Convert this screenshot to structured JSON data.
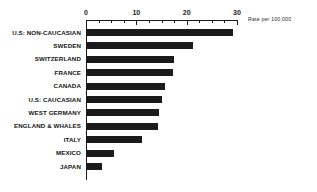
{
  "chart_data": {
    "type": "bar",
    "orientation": "horizontal",
    "title": "",
    "subtitle": "",
    "xlabel": "",
    "ylabel": "",
    "annotation": "Rate per 100,000",
    "xlim": [
      0,
      30
    ],
    "grid": false,
    "legend": null,
    "bar_color": "#1b1b1b",
    "axis_color": "#1a1a1a",
    "tick_labels": [
      "0",
      "10",
      "20",
      "30"
    ],
    "tick_values": [
      0,
      10,
      20,
      30
    ],
    "minor_tick_values": [
      2.5,
      5,
      7.5,
      12.5,
      15,
      17.5,
      22.5,
      25,
      27.5
    ],
    "categories": [
      "U.S: NON-CAUCASIAN",
      "SWEDEN",
      "SWITZERLAND",
      "FRANCE",
      "CANADA",
      "U.S: CAUCASIAN",
      "WEST GERMANY",
      "ENGLAND & WHALES",
      "ITALY",
      "MEXICO",
      "JAPAN"
    ],
    "values": [
      29,
      21,
      17.3,
      17,
      15.5,
      14.9,
      14.3,
      14.1,
      11,
      5.4,
      3
    ]
  }
}
